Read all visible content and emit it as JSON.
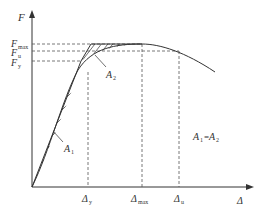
{
  "diagram": {
    "axes": {
      "y_label": "F",
      "x_label": "Δ"
    },
    "y_ticks": [
      {
        "base": "F",
        "sub": "max"
      },
      {
        "base": "F",
        "sub": "u"
      },
      {
        "base": "F",
        "sub": "y"
      }
    ],
    "x_ticks": [
      {
        "base": "Δ",
        "sub": "y"
      },
      {
        "base": "Δ",
        "sub": "max"
      },
      {
        "base": "Δ",
        "sub": "u"
      }
    ],
    "areas": [
      {
        "base": "A",
        "sub": "1"
      },
      {
        "base": "A",
        "sub": "2"
      }
    ],
    "equation": {
      "a": "A",
      "a_sub": "1",
      "eq": "=",
      "b": "A",
      "b_sub": "2"
    },
    "colors": {
      "line": "#333333",
      "dashed": "#555555",
      "background": "#ffffff"
    }
  }
}
